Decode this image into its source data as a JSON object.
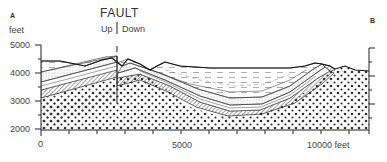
{
  "diagram": {
    "type": "geologic-cross-section",
    "endpoints": {
      "left": "A",
      "right": "B"
    },
    "fault": {
      "title": "FAULT",
      "up_label": "Up",
      "down_label": "Down"
    },
    "y_axis": {
      "unit_label": "feet",
      "ticks": [
        "5000",
        "4000",
        "3000",
        "2000"
      ]
    },
    "x_axis": {
      "ticks": [
        "0",
        "5000",
        "10000 feet"
      ]
    },
    "layers": [
      "dashed shale (youngest, basin fill)",
      "stippled sandstone",
      "thin banded beds",
      "hatched/cross-hatched bed",
      "dotted conglomerate/basement (oldest)"
    ],
    "structure": "asymmetric syncline east of a normal fault"
  }
}
